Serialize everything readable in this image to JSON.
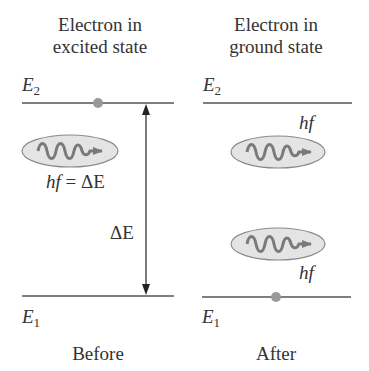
{
  "panels": {
    "before": {
      "title_line1": "Electron in",
      "title_line2": "excited state",
      "upper_level": {
        "label": "E",
        "subscript": "2"
      },
      "lower_level": {
        "label": "E",
        "subscript": "1"
      },
      "photon_label_italic": "hf",
      "photon_label_rest": " = ΔE",
      "gap_label": "ΔE",
      "caption": "Before"
    },
    "after": {
      "title_line1": "Electron in",
      "title_line2": "ground state",
      "upper_level": {
        "label": "E",
        "subscript": "2"
      },
      "lower_level": {
        "label": "E",
        "subscript": "1"
      },
      "photon_top_label": "hf",
      "photon_bottom_label": "hf",
      "caption": "After"
    }
  },
  "colors": {
    "line": "#555555",
    "electron": "#999999",
    "ellipse_fill": "#e4e4e4",
    "ellipse_stroke": "#8a8a8a",
    "wave": "#7a7a7a"
  }
}
